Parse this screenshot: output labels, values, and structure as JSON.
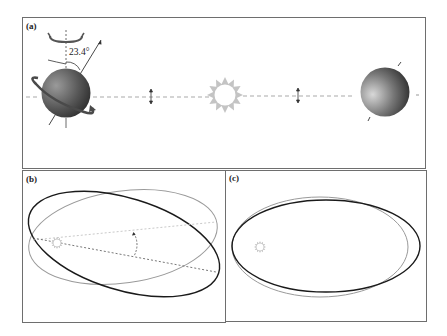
{
  "figure": {
    "panels": [
      {
        "id": "a",
        "label": "(a)"
      },
      {
        "id": "b",
        "label": "(b)"
      },
      {
        "id": "c",
        "label": "(c)"
      }
    ],
    "panel_a": {
      "tilt_angle_label": "23.4°",
      "elements": [
        "earth-left-tilted",
        "sun",
        "earth-right",
        "dashed-orbit-line",
        "precession-arrow",
        "rotation-arrow",
        "oscillation-arrows"
      ]
    },
    "panel_b": {
      "description": "Orbit inclination change: two tilted ellipses with angle between their major axes",
      "elements": [
        "ellipse-gray",
        "ellipse-black",
        "sun",
        "dashed-axes",
        "angle-arc"
      ]
    },
    "panel_c": {
      "description": "Orbit eccentricity change: two ellipses of differing eccentricity sharing a focus",
      "elements": [
        "ellipse-gray",
        "ellipse-black",
        "sun"
      ]
    },
    "colors": {
      "border": "#6e6e6e",
      "dashed": "#aaaaaa",
      "sun": "#b8b8b8",
      "orbit_black": "#1a1a1a",
      "orbit_gray": "#9a9a9a"
    }
  }
}
